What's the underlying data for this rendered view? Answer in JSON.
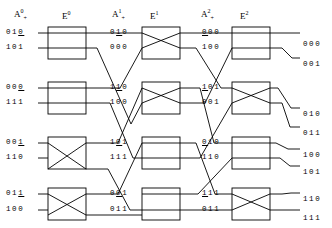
{
  "diagram": {
    "type": "butterfly-network",
    "colors": {
      "line": "#000000",
      "background": "#ffffff",
      "text": "#000000"
    },
    "stage_headers": [
      {
        "name": "A0",
        "base": "A",
        "sup": "0",
        "sub": "+",
        "x": 14,
        "y": 8
      },
      {
        "name": "E0",
        "base": "E",
        "sup": "0",
        "sub": "",
        "x": 62,
        "y": 10
      },
      {
        "name": "A1",
        "base": "A",
        "sup": "1",
        "sub": "+",
        "x": 112,
        "y": 8
      },
      {
        "name": "E1",
        "base": "E",
        "sup": "1",
        "sub": "",
        "x": 148,
        "y": 10
      },
      {
        "name": "A2",
        "base": "A",
        "sup": "2",
        "sub": "+",
        "x": 201,
        "y": 8
      },
      {
        "name": "E2",
        "base": "E",
        "sup": "2",
        "sub": "",
        "x": 238,
        "y": 10
      }
    ],
    "inputs": [
      {
        "bits": [
          "0",
          "1",
          "0"
        ],
        "underline": 2,
        "x": 6,
        "y": 29
      },
      {
        "bits": [
          "1",
          "0",
          "1"
        ],
        "underline": -1,
        "x": 6,
        "y": 44
      },
      {
        "bits": [
          "0",
          "0",
          "0"
        ],
        "underline": 2,
        "x": 6,
        "y": 84
      },
      {
        "bits": [
          "1",
          "1",
          "1"
        ],
        "underline": -1,
        "x": 6,
        "y": 99
      },
      {
        "bits": [
          "0",
          "0",
          "1"
        ],
        "underline": 2,
        "x": 6,
        "y": 139
      },
      {
        "bits": [
          "1",
          "1",
          "0"
        ],
        "underline": -1,
        "x": 6,
        "y": 154
      },
      {
        "bits": [
          "0",
          "1",
          "1"
        ],
        "underline": 2,
        "x": 6,
        "y": 190
      },
      {
        "bits": [
          "1",
          "0",
          "0"
        ],
        "underline": -1,
        "x": 6,
        "y": 206
      }
    ],
    "stage1_labels": [
      {
        "bits": [
          "0",
          "1",
          "0"
        ],
        "underline": 1,
        "x": 110,
        "y": 29
      },
      {
        "bits": [
          "0",
          "0",
          "0"
        ],
        "underline": -1,
        "x": 110,
        "y": 44
      },
      {
        "bits": [
          "1",
          "1",
          "0"
        ],
        "underline": 1,
        "x": 110,
        "y": 84
      },
      {
        "bits": [
          "1",
          "0",
          "0"
        ],
        "underline": -1,
        "x": 110,
        "y": 99
      },
      {
        "bits": [
          "1",
          "0",
          "1"
        ],
        "underline": 1,
        "x": 110,
        "y": 139
      },
      {
        "bits": [
          "1",
          "1",
          "1"
        ],
        "underline": -1,
        "x": 110,
        "y": 154
      },
      {
        "bits": [
          "0",
          "0",
          "1"
        ],
        "underline": 1,
        "x": 110,
        "y": 190
      },
      {
        "bits": [
          "0",
          "1",
          "1"
        ],
        "underline": -1,
        "x": 110,
        "y": 206
      }
    ],
    "stage2_labels": [
      {
        "bits": [
          "0",
          "0",
          "0"
        ],
        "underline": 0,
        "x": 202,
        "y": 29
      },
      {
        "bits": [
          "1",
          "0",
          "0"
        ],
        "underline": -1,
        "x": 202,
        "y": 44
      },
      {
        "bits": [
          "1",
          "0",
          "1"
        ],
        "underline": 0,
        "x": 202,
        "y": 84
      },
      {
        "bits": [
          "0",
          "0",
          "1"
        ],
        "underline": -1,
        "x": 202,
        "y": 99
      },
      {
        "bits": [
          "0",
          "1",
          "0"
        ],
        "underline": 0,
        "x": 202,
        "y": 139
      },
      {
        "bits": [
          "1",
          "1",
          "0"
        ],
        "underline": -1,
        "x": 202,
        "y": 154
      },
      {
        "bits": [
          "1",
          "1",
          "1"
        ],
        "underline": 0,
        "x": 202,
        "y": 190
      },
      {
        "bits": [
          "0",
          "1",
          "1"
        ],
        "underline": -1,
        "x": 202,
        "y": 206
      }
    ],
    "outputs": [
      {
        "bits": [
          "0",
          "0",
          "0"
        ],
        "x": 303,
        "y": 41
      },
      {
        "bits": [
          "0",
          "0",
          "1"
        ],
        "x": 303,
        "y": 61
      },
      {
        "bits": [
          "0",
          "1",
          "0"
        ],
        "x": 303,
        "y": 111
      },
      {
        "bits": [
          "0",
          "1",
          "1"
        ],
        "x": 303,
        "y": 130
      },
      {
        "bits": [
          "1",
          "0",
          "0"
        ],
        "x": 303,
        "y": 152
      },
      {
        "bits": [
          "1",
          "0",
          "1"
        ],
        "x": 303,
        "y": 169
      },
      {
        "bits": [
          "1",
          "1",
          "0"
        ],
        "x": 303,
        "y": 196
      },
      {
        "bits": [
          "1",
          "1",
          "1"
        ],
        "x": 303,
        "y": 215
      }
    ],
    "switches": [
      {
        "name": "switch-s0-0",
        "stage": 0,
        "x": 48,
        "y": 27,
        "w": 38,
        "h": 32,
        "mode": "straight"
      },
      {
        "name": "switch-s0-1",
        "stage": 0,
        "x": 48,
        "y": 82,
        "w": 38,
        "h": 32,
        "mode": "straight"
      },
      {
        "name": "switch-s0-2",
        "stage": 0,
        "x": 48,
        "y": 137,
        "w": 38,
        "h": 32,
        "mode": "cross"
      },
      {
        "name": "switch-s0-3",
        "stage": 0,
        "x": 48,
        "y": 188,
        "w": 38,
        "h": 32,
        "mode": "cross"
      },
      {
        "name": "switch-s1-0",
        "stage": 1,
        "x": 142,
        "y": 27,
        "w": 38,
        "h": 32,
        "mode": "cross"
      },
      {
        "name": "switch-s1-1",
        "stage": 1,
        "x": 142,
        "y": 82,
        "w": 38,
        "h": 32,
        "mode": "cross"
      },
      {
        "name": "switch-s1-2",
        "stage": 1,
        "x": 142,
        "y": 137,
        "w": 38,
        "h": 32,
        "mode": "straight"
      },
      {
        "name": "switch-s1-3",
        "stage": 1,
        "x": 142,
        "y": 188,
        "w": 38,
        "h": 32,
        "mode": "straight"
      },
      {
        "name": "switch-s2-0",
        "stage": 2,
        "x": 232,
        "y": 27,
        "w": 38,
        "h": 32,
        "mode": "straight"
      },
      {
        "name": "switch-s2-1",
        "stage": 2,
        "x": 232,
        "y": 82,
        "w": 38,
        "h": 32,
        "mode": "cross"
      },
      {
        "name": "switch-s2-2",
        "stage": 2,
        "x": 232,
        "y": 137,
        "w": 38,
        "h": 32,
        "mode": "straight"
      },
      {
        "name": "switch-s2-3",
        "stage": 2,
        "x": 232,
        "y": 188,
        "w": 38,
        "h": 32,
        "mode": "cross"
      }
    ]
  }
}
